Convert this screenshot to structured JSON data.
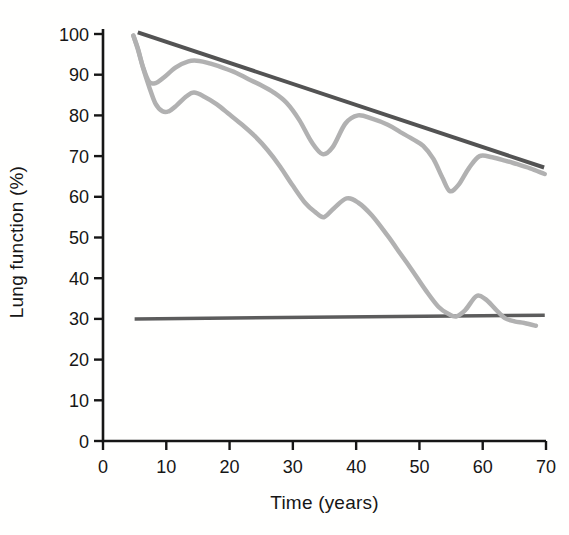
{
  "chart_data": {
    "type": "line",
    "title": "",
    "xlabel": "Time (years)",
    "ylabel": "Lung function (%)",
    "xlim": [
      0,
      70
    ],
    "ylim": [
      0,
      100
    ],
    "x_ticks": [
      0,
      10,
      20,
      30,
      40,
      50,
      60,
      70
    ],
    "y_ticks": [
      0,
      10,
      20,
      30,
      40,
      50,
      60,
      70,
      80,
      90,
      100
    ],
    "grid": false,
    "legend": "none",
    "axis_color": "#161616",
    "series": [
      {
        "name": "straight-declining-reference-line",
        "shape": "straight",
        "color": "#535353",
        "width": 4,
        "points": [
          [
            5.5,
            100.4
          ],
          [
            69.7,
            67.2
          ]
        ]
      },
      {
        "name": "horizontal-threshold-line",
        "shape": "straight",
        "color": "#5c5c5c",
        "width": 3.5,
        "points": [
          [
            5,
            30
          ],
          [
            69.8,
            30.9
          ]
        ]
      },
      {
        "name": "upper-wavy-gray-curve",
        "shape": "smooth",
        "color": "#b1b1b1",
        "width": 4.5,
        "points": [
          [
            4.8,
            99.6
          ],
          [
            5.5,
            96.5
          ],
          [
            6.3,
            92
          ],
          [
            7.3,
            88.2
          ],
          [
            8.4,
            88
          ],
          [
            9.6,
            89.3
          ],
          [
            11.5,
            91.8
          ],
          [
            13.5,
            93.3
          ],
          [
            15.2,
            93.4
          ],
          [
            17,
            92.7
          ],
          [
            19,
            91.7
          ],
          [
            21,
            90.5
          ],
          [
            23,
            88.9
          ],
          [
            25,
            87.4
          ],
          [
            27,
            85.6
          ],
          [
            29,
            83.1
          ],
          [
            31,
            78.9
          ],
          [
            33,
            73.4
          ],
          [
            34.7,
            70.5
          ],
          [
            36.3,
            72.2
          ],
          [
            38.3,
            78
          ],
          [
            40.3,
            80
          ],
          [
            42.5,
            79.2
          ],
          [
            45,
            77.7
          ],
          [
            47,
            75.9
          ],
          [
            49,
            74.1
          ],
          [
            50.6,
            72.5
          ],
          [
            52.2,
            69.3
          ],
          [
            53.6,
            64.8
          ],
          [
            54.8,
            61.4
          ],
          [
            56.2,
            63
          ],
          [
            57.8,
            67
          ],
          [
            59.5,
            70
          ],
          [
            61.5,
            69.7
          ],
          [
            63.5,
            68.9
          ],
          [
            65.5,
            68
          ],
          [
            67.5,
            67
          ],
          [
            69.8,
            65.6
          ]
        ]
      },
      {
        "name": "lower-wavy-gray-curve",
        "shape": "smooth",
        "color": "#b1b1b1",
        "width": 4.5,
        "points": [
          [
            4.8,
            99.6
          ],
          [
            5.5,
            96.3
          ],
          [
            6.3,
            91.8
          ],
          [
            7.3,
            87
          ],
          [
            8.3,
            82.9
          ],
          [
            9.4,
            81
          ],
          [
            10.4,
            81
          ],
          [
            11.6,
            82.4
          ],
          [
            13.2,
            84.7
          ],
          [
            14.4,
            85.6
          ],
          [
            16,
            84.6
          ],
          [
            18,
            82.7
          ],
          [
            20,
            80.2
          ],
          [
            22,
            77.7
          ],
          [
            24,
            74.9
          ],
          [
            26,
            71.5
          ],
          [
            28,
            67.4
          ],
          [
            30,
            62.7
          ],
          [
            32,
            58.4
          ],
          [
            33.5,
            56.3
          ],
          [
            34.9,
            55
          ],
          [
            36.5,
            57.2
          ],
          [
            38.5,
            59.6
          ],
          [
            40.3,
            58.6
          ],
          [
            42.5,
            55.4
          ],
          [
            45,
            50.4
          ],
          [
            47,
            46
          ],
          [
            49,
            41.6
          ],
          [
            51,
            37
          ],
          [
            53,
            33
          ],
          [
            54.6,
            31.2
          ],
          [
            55.8,
            30.6
          ],
          [
            57.2,
            32.1
          ],
          [
            59,
            35.6
          ],
          [
            60.4,
            34.9
          ],
          [
            62,
            32.4
          ],
          [
            63.5,
            30.2
          ],
          [
            65,
            29.4
          ],
          [
            66.6,
            29
          ],
          [
            68.4,
            28.3
          ]
        ]
      }
    ]
  }
}
